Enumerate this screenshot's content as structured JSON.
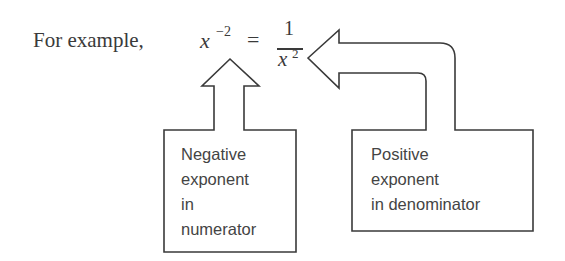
{
  "equation": {
    "prefix": "For example,",
    "base": "x",
    "exponent": "−2",
    "equals": "=",
    "numerator": "1",
    "denominator_base": "x",
    "denominator_exponent": "2"
  },
  "callouts": {
    "left": {
      "lines": [
        "Negative",
        "exponent",
        "in",
        "numerator"
      ],
      "points_to": "x^-2"
    },
    "right": {
      "lines": [
        "Positive",
        "exponent",
        "in denominator"
      ],
      "points_to": "1/x^2"
    }
  },
  "colors": {
    "background": "#ffffff",
    "ink": "#3a3a3a",
    "label_text": "#444444"
  }
}
